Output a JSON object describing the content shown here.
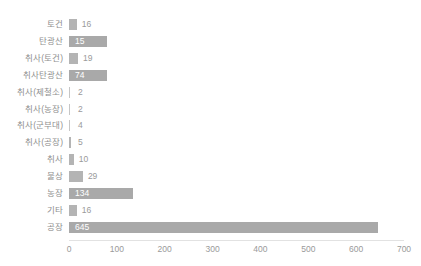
{
  "chart": {
    "title": "",
    "type_label": "horizontal-bar"
  },
  "axis": {
    "xlabel": "",
    "ylabel": "",
    "xticks": [
      "0",
      "100",
      "200",
      "300",
      "400",
      "500",
      "600",
      "700"
    ]
  },
  "colors": {
    "bar": "#b4b4b4",
    "bar_highlight": "#a9a9a9",
    "value_label": "#9a9a9a",
    "value_label_inside": "#ffffff",
    "category_label": "#8f8f8f",
    "axis": "#e2e2e2",
    "background": "#ffffff"
  },
  "chart_data": {
    "type": "bar",
    "orientation": "horizontal",
    "title": "",
    "xlabel": "",
    "ylabel": "",
    "xlim": [
      0,
      700
    ],
    "grid": false,
    "legend": false,
    "categories": [
      "토건",
      "탄광산",
      "취사(토건)",
      "취사탄광산",
      "취사(제철소)",
      "취사(농장)",
      "취사(군부대)",
      "취사(공장)",
      "취사",
      "불상",
      "농장",
      "기타",
      "공장"
    ],
    "values": [
      16,
      15,
      19,
      74,
      2,
      2,
      4,
      5,
      10,
      29,
      134,
      16,
      645
    ],
    "labels": [
      "16",
      "15",
      "19",
      "74",
      "2",
      "2",
      "4",
      "5",
      "10",
      "29",
      "134",
      "16",
      "645"
    ],
    "highlighted": [
      false,
      true,
      false,
      true,
      false,
      false,
      false,
      false,
      false,
      false,
      true,
      false,
      true
    ],
    "label_inside": [
      false,
      true,
      false,
      true,
      false,
      false,
      false,
      false,
      false,
      false,
      true,
      false,
      true
    ]
  }
}
